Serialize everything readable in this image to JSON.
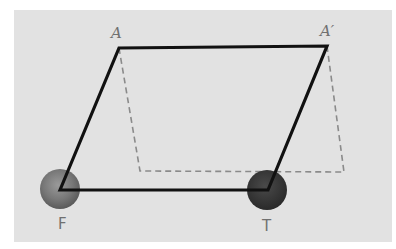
{
  "diagram": {
    "type": "parallelogram-shear",
    "labels": {
      "A": "A",
      "A_prime": "A′",
      "F": "F",
      "T": "T"
    },
    "points": {
      "A": [
        119,
        48
      ],
      "A_prime": [
        327,
        46
      ],
      "F": [
        60,
        190
      ],
      "T": [
        268,
        190
      ],
      "dashed_bottom_left": [
        140,
        171
      ],
      "dashed_bottom_right": [
        344,
        172
      ]
    },
    "solid_shape": "parallelogram F-A-A'-T",
    "dashed_shape": "A-(140,171)-(344,172)-A'",
    "markers": [
      {
        "name": "F",
        "center": [
          60,
          189
        ],
        "radius": 20,
        "color": "#7a7a7a"
      },
      {
        "name": "T",
        "center": [
          267,
          190
        ],
        "radius": 20,
        "color": "#3a3a3a"
      }
    ],
    "colors": {
      "paper": "#e2e2e2",
      "solid_line": "#111111",
      "dashed_line": "#8a8a8a",
      "label_text": "#707070"
    }
  }
}
